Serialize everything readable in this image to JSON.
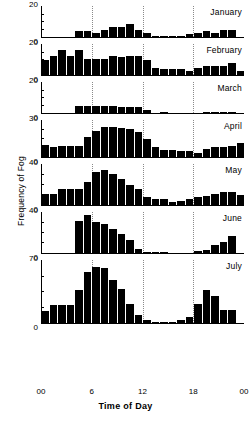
{
  "chart_data": {
    "type": "bar",
    "title": "",
    "xlabel": "Time of Day",
    "ylabel": "Frequency of Fog",
    "x": [
      0,
      1,
      2,
      3,
      4,
      5,
      6,
      7,
      8,
      9,
      10,
      11,
      12,
      13,
      14,
      15,
      16,
      17,
      18,
      19,
      20,
      21,
      22,
      23
    ],
    "xtick_labels": [
      "00",
      "6",
      "12",
      "18",
      "00"
    ],
    "xtick_positions": [
      0,
      6,
      12,
      18,
      24
    ],
    "gridlines_at": [
      6,
      12,
      18
    ],
    "grid": true,
    "legend": "none",
    "bar_color": "#000000",
    "panels": [
      {
        "name": "January",
        "ylim": [
          0,
          20
        ],
        "ytick_labels": [
          "0",
          "20"
        ],
        "values": [
          0,
          0,
          0,
          0,
          4,
          4,
          3,
          5,
          7,
          7,
          9,
          5,
          3,
          1,
          1,
          1,
          1,
          2,
          3,
          4,
          3,
          5,
          5,
          0
        ]
      },
      {
        "name": "February",
        "ylim": [
          0,
          20
        ],
        "ytick_labels": [
          "0",
          "20"
        ],
        "values": [
          10,
          13,
          17,
          13,
          17,
          11,
          11,
          11,
          13,
          12,
          13,
          13,
          10,
          5,
          4,
          4,
          4,
          3,
          5,
          6,
          6,
          6,
          8,
          3
        ]
      },
      {
        "name": "March",
        "ylim": [
          0,
          20
        ],
        "ytick_labels": [
          "0",
          "20"
        ],
        "values": [
          0,
          0,
          0,
          0,
          5,
          5,
          5,
          5,
          5,
          4,
          4,
          4,
          2,
          0,
          1,
          0,
          0,
          0,
          0,
          1,
          1,
          1,
          1,
          0
        ]
      },
      {
        "name": "April",
        "ylim": [
          0,
          30
        ],
        "ytick_labels": [
          "0",
          "30"
        ],
        "values": [
          10,
          8,
          9,
          9,
          9,
          17,
          22,
          25,
          25,
          24,
          23,
          21,
          15,
          8,
          6,
          6,
          5,
          5,
          3,
          7,
          8,
          8,
          9,
          12
        ]
      },
      {
        "name": "May",
        "ylim": [
          0,
          40
        ],
        "ytick_labels": [
          "0",
          "40"
        ],
        "values": [
          11,
          11,
          16,
          16,
          16,
          23,
          33,
          35,
          31,
          26,
          20,
          16,
          8,
          6,
          6,
          3,
          4,
          6,
          8,
          9,
          11,
          13,
          13,
          10
        ]
      },
      {
        "name": "June",
        "ylim": [
          0,
          40
        ],
        "ytick_labels": [
          "0",
          "40"
        ],
        "values": [
          0,
          0,
          0,
          0,
          32,
          38,
          31,
          29,
          24,
          19,
          13,
          4,
          1,
          1,
          1,
          0,
          0,
          0,
          2,
          3,
          8,
          11,
          17,
          0
        ]
      },
      {
        "name": "July",
        "ylim": [
          0,
          70
        ],
        "ytick_labels": [
          "0",
          "70"
        ],
        "values": [
          14,
          20,
          20,
          20,
          37,
          58,
          63,
          62,
          49,
          38,
          22,
          9,
          3,
          1,
          1,
          1,
          3,
          7,
          22,
          37,
          31,
          15,
          15,
          0
        ]
      }
    ]
  }
}
